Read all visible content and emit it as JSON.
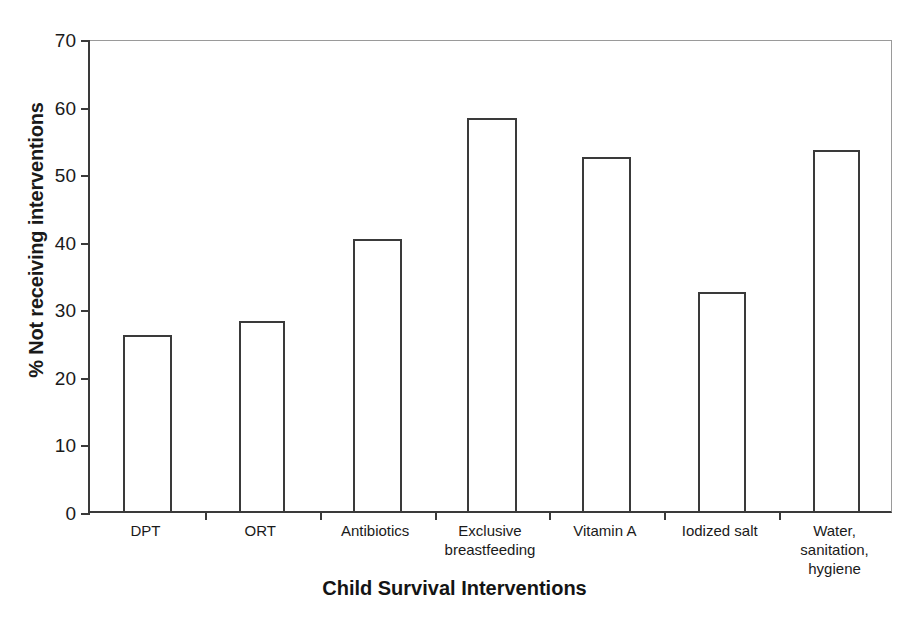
{
  "chart_data": {
    "type": "bar",
    "title": "",
    "xlabel": "Child Survival Interventions",
    "ylabel": "% Not receiving interventions",
    "categories": [
      "DPT",
      "ORT",
      "Antibiotics",
      "Exclusive\nbreastfeeding",
      "Vitamin  A",
      "Iodized salt",
      "Water,\nsanitation,\nhygiene"
    ],
    "category_labels": [
      [
        "DPT"
      ],
      [
        "ORT"
      ],
      [
        "Antibiotics"
      ],
      [
        "Exclusive",
        "breastfeeding"
      ],
      [
        "Vitamin  A"
      ],
      [
        "Iodized salt"
      ],
      [
        "Water,",
        "sanitation,",
        "hygiene"
      ]
    ],
    "values": [
      26.0,
      28.1,
      40.2,
      58.2,
      52.4,
      32.4,
      53.4
    ],
    "ylim": [
      0,
      70
    ],
    "yticks": [
      0,
      10,
      20,
      30,
      40,
      50,
      60,
      70
    ],
    "ytick_labels": [
      "0",
      "10",
      "20",
      "30",
      "40",
      "50",
      "60",
      "70"
    ],
    "grid": false,
    "legend": null,
    "bar_fill": "#ffffff",
    "bar_edge": "#3a3a3a",
    "axis_color": "#3a3a3a",
    "frame_color": "#9a9a9a",
    "background": "#ffffff"
  }
}
